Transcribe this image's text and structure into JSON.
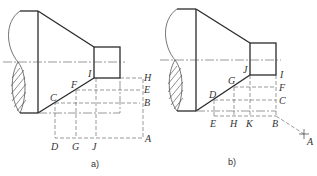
{
  "figure": {
    "panels": [
      {
        "id": "a",
        "caption": "a)",
        "labels": {
          "I": "I",
          "F": "F",
          "C": "C",
          "H": "H",
          "E": "E",
          "B": "B",
          "D": "D",
          "G": "G",
          "J": "J",
          "A": "A"
        }
      },
      {
        "id": "b",
        "caption": "b)",
        "labels": {
          "J": "J",
          "G": "G",
          "D": "D",
          "I": "I",
          "F": "F",
          "C": "C",
          "E": "E",
          "H": "H",
          "K": "K",
          "B": "B",
          "A": "A"
        }
      }
    ]
  }
}
